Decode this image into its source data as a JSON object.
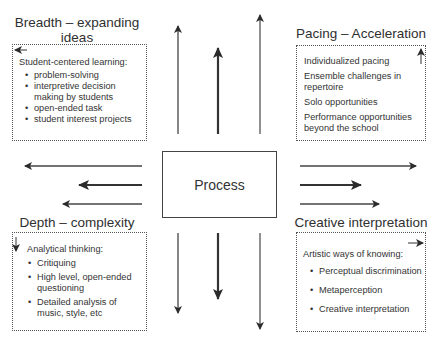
{
  "center": {
    "label": "Process"
  },
  "quadrants": {
    "top_left": {
      "title_line1": "Breadth – expanding",
      "title_line2": "ideas",
      "heading": "Student-centered learning:",
      "items": [
        "problem-solving",
        "interpretive decision making by students",
        "open-ended task",
        "student interest projects"
      ],
      "corner_arrow": "left"
    },
    "top_right": {
      "title": "Pacing – Acceleration",
      "items": [
        "Individualized pacing",
        "Ensemble challenges in repertoire",
        "Solo opportunities",
        "Performance opportunities beyond the school"
      ],
      "corner_arrow": "up"
    },
    "bottom_left": {
      "title": "Depth – complexity",
      "heading": "Analytical thinking:",
      "items": [
        "Critiquing",
        "High level, open-ended questioning",
        "Detailed analysis of music, style, etc"
      ],
      "corner_arrow": "down"
    },
    "bottom_right": {
      "title": "Creative interpretation",
      "heading": "Artistic ways of knowing:",
      "items": [
        "Perceptual discrimination",
        "Metaperception",
        "Creative interpretation"
      ],
      "corner_arrow": "right"
    }
  },
  "bullet": "•",
  "colors": {
    "line": "#444444",
    "text": "#2f2f2f",
    "border": "#555555"
  }
}
